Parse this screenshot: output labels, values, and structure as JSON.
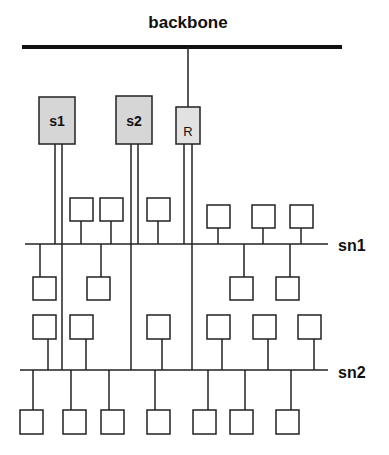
{
  "diagram": {
    "backbone": {
      "label": "backbone",
      "x1": 22,
      "x2": 342,
      "y": 47,
      "thickness": 4
    },
    "subnets": [
      {
        "id": "sn1",
        "label": "sn1",
        "x1": 25,
        "x2": 328,
        "y": 244
      },
      {
        "id": "sn2",
        "label": "sn2",
        "x1": 20,
        "x2": 328,
        "y": 370
      }
    ],
    "servers": [
      {
        "id": "s1",
        "label": "s1",
        "x": 39,
        "y": 97,
        "w": 36,
        "h": 47
      },
      {
        "id": "s2",
        "label": "s2",
        "x": 116,
        "y": 96,
        "w": 36,
        "h": 48
      },
      {
        "id": "R",
        "label": "R",
        "x": 176,
        "y": 107,
        "w": 24,
        "h": 37
      }
    ],
    "colors": {
      "line": "#1a1a1a",
      "server_fill": "#d6d6d6",
      "node_fill": "#ffffff"
    }
  }
}
